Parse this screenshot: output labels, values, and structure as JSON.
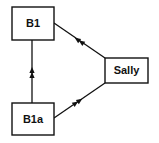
{
  "diagram": {
    "type": "directed-graph",
    "nodes": [
      {
        "id": "B1",
        "label": "B1"
      },
      {
        "id": "Sally",
        "label": "Sally"
      },
      {
        "id": "B1a",
        "label": "B1a"
      }
    ],
    "edges": [
      {
        "from": "Sally",
        "to": "B1",
        "arrow": "double-arrowhead"
      },
      {
        "from": "B1a",
        "to": "B1",
        "arrow": "double-arrowhead"
      },
      {
        "from": "B1a",
        "to": "Sally",
        "arrow": "double-arrowhead"
      }
    ]
  },
  "colors": {
    "stroke": "#111111",
    "background": "#ffffff"
  }
}
